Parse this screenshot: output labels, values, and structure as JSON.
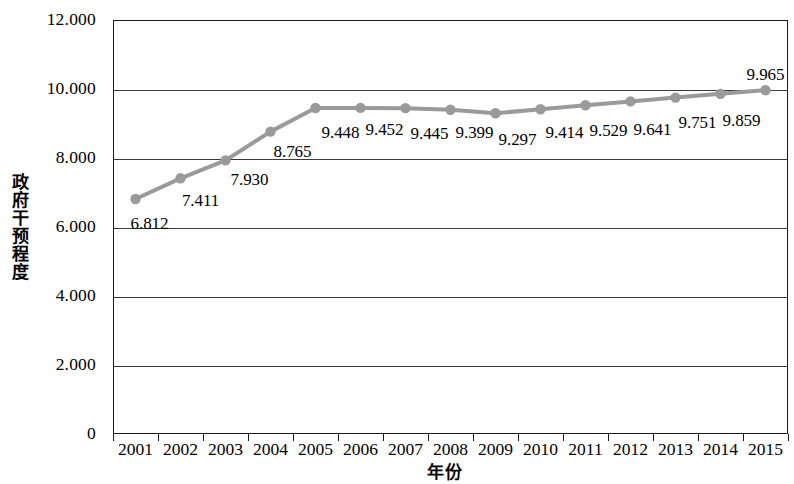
{
  "chart_data": {
    "type": "line",
    "title": "",
    "xlabel": "年份",
    "ylabel": "政府干预程度",
    "categories": [
      "2001",
      "2002",
      "2003",
      "2004",
      "2005",
      "2006",
      "2007",
      "2008",
      "2009",
      "2010",
      "2011",
      "2012",
      "2013",
      "2014",
      "2015"
    ],
    "values": [
      6.812,
      7.411,
      7.93,
      8.765,
      9.448,
      9.452,
      9.445,
      9.399,
      9.297,
      9.414,
      9.529,
      9.641,
      9.751,
      9.859,
      9.965
    ],
    "point_labels": [
      "6.812",
      "7.411",
      "7.930",
      "8.765",
      "9.448",
      "9.452",
      "9.445",
      "9.399",
      "9.297",
      "9.414",
      "9.529",
      "9.641",
      "9.751",
      "9.859",
      "9.965"
    ],
    "ylim": [
      0,
      12
    ],
    "ytick_labels": [
      "12.000",
      "10.000",
      "8.000",
      "6.000",
      "4.000",
      "2.000",
      "0"
    ],
    "ytick_values": [
      12,
      10,
      8,
      6,
      4,
      2,
      0
    ],
    "grid": true,
    "grid_axis": "y",
    "legend": null,
    "series_color": "#9a9a9a",
    "marker": "circle",
    "axis_color": "#1a1a1a"
  }
}
